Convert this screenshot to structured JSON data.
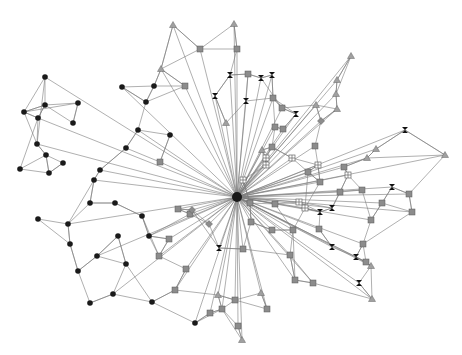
{
  "diagram": {
    "type": "network-graph",
    "hub": {
      "x": 237,
      "y": 197
    },
    "node_types": {
      "circle": "black",
      "square": "gray",
      "triangle": "gray",
      "grid-square": "white-crossed",
      "hourglass": "black",
      "diamond": "gray"
    },
    "colors": {
      "edge": "#7a7a7a",
      "black": "#1a1a1a",
      "gray": "#8c8c8c"
    },
    "nodes": [
      {
        "t": "circle",
        "x": 45,
        "y": 77
      },
      {
        "t": "circle",
        "x": 45,
        "y": 105
      },
      {
        "t": "circle",
        "x": 24,
        "y": 112
      },
      {
        "t": "circle",
        "x": 38,
        "y": 118
      },
      {
        "t": "circle",
        "x": 78,
        "y": 103
      },
      {
        "t": "circle",
        "x": 73,
        "y": 123
      },
      {
        "t": "circle",
        "x": 122,
        "y": 87
      },
      {
        "t": "circle",
        "x": 154,
        "y": 86
      },
      {
        "t": "circle",
        "x": 146,
        "y": 102
      },
      {
        "t": "circle",
        "x": 138,
        "y": 130
      },
      {
        "t": "circle",
        "x": 170,
        "y": 135
      },
      {
        "t": "circle",
        "x": 126,
        "y": 148
      },
      {
        "t": "circle",
        "x": 37,
        "y": 144
      },
      {
        "t": "circle",
        "x": 46,
        "y": 155
      },
      {
        "t": "circle",
        "x": 63,
        "y": 163
      },
      {
        "t": "circle",
        "x": 100,
        "y": 170
      },
      {
        "t": "circle",
        "x": 20,
        "y": 169
      },
      {
        "t": "circle",
        "x": 49,
        "y": 173
      },
      {
        "t": "circle",
        "x": 94,
        "y": 180
      },
      {
        "t": "circle",
        "x": 115,
        "y": 203
      },
      {
        "t": "circle",
        "x": 142,
        "y": 216
      },
      {
        "t": "circle",
        "x": 149,
        "y": 236
      },
      {
        "t": "circle",
        "x": 90,
        "y": 203
      },
      {
        "t": "circle",
        "x": 38,
        "y": 219
      },
      {
        "t": "circle",
        "x": 68,
        "y": 224
      },
      {
        "t": "circle",
        "x": 70,
        "y": 244
      },
      {
        "t": "circle",
        "x": 118,
        "y": 236
      },
      {
        "t": "circle",
        "x": 97,
        "y": 256
      },
      {
        "t": "circle",
        "x": 126,
        "y": 264
      },
      {
        "t": "circle",
        "x": 78,
        "y": 271
      },
      {
        "t": "circle",
        "x": 113,
        "y": 294
      },
      {
        "t": "circle",
        "x": 90,
        "y": 303
      },
      {
        "t": "circle",
        "x": 152,
        "y": 302
      },
      {
        "t": "circle",
        "x": 195,
        "y": 323
      },
      {
        "t": "triangle",
        "x": 173,
        "y": 25
      },
      {
        "t": "triangle",
        "x": 234,
        "y": 24
      },
      {
        "t": "triangle",
        "x": 161,
        "y": 69
      },
      {
        "t": "triangle",
        "x": 351,
        "y": 56
      },
      {
        "t": "triangle",
        "x": 337,
        "y": 80
      },
      {
        "t": "triangle",
        "x": 336,
        "y": 94
      },
      {
        "t": "triangle",
        "x": 316,
        "y": 105
      },
      {
        "t": "triangle",
        "x": 337,
        "y": 109
      },
      {
        "t": "triangle",
        "x": 226,
        "y": 123
      },
      {
        "t": "triangle",
        "x": 376,
        "y": 149
      },
      {
        "t": "triangle",
        "x": 445,
        "y": 155
      },
      {
        "t": "triangle",
        "x": 367,
        "y": 158
      },
      {
        "t": "triangle",
        "x": 262,
        "y": 150
      },
      {
        "t": "triangle",
        "x": 371,
        "y": 266
      },
      {
        "t": "triangle",
        "x": 372,
        "y": 299
      },
      {
        "t": "triangle",
        "x": 261,
        "y": 293
      },
      {
        "t": "triangle",
        "x": 242,
        "y": 340
      },
      {
        "t": "triangle",
        "x": 218,
        "y": 295
      },
      {
        "t": "square",
        "x": 200,
        "y": 49
      },
      {
        "t": "square",
        "x": 185,
        "y": 86
      },
      {
        "t": "square",
        "x": 237,
        "y": 49
      },
      {
        "t": "square",
        "x": 248,
        "y": 74
      },
      {
        "t": "square",
        "x": 273,
        "y": 98
      },
      {
        "t": "square",
        "x": 282,
        "y": 108
      },
      {
        "t": "square",
        "x": 275,
        "y": 127
      },
      {
        "t": "square",
        "x": 283,
        "y": 129
      },
      {
        "t": "square",
        "x": 272,
        "y": 147
      },
      {
        "t": "square",
        "x": 315,
        "y": 146
      },
      {
        "t": "square",
        "x": 160,
        "y": 162
      },
      {
        "t": "square",
        "x": 178,
        "y": 209
      },
      {
        "t": "square",
        "x": 190,
        "y": 214
      },
      {
        "t": "square",
        "x": 169,
        "y": 239
      },
      {
        "t": "square",
        "x": 159,
        "y": 256
      },
      {
        "t": "square",
        "x": 186,
        "y": 269
      },
      {
        "t": "square",
        "x": 175,
        "y": 290
      },
      {
        "t": "square",
        "x": 222,
        "y": 309
      },
      {
        "t": "square",
        "x": 210,
        "y": 313
      },
      {
        "t": "square",
        "x": 238,
        "y": 326
      },
      {
        "t": "square",
        "x": 243,
        "y": 249
      },
      {
        "t": "square",
        "x": 250,
        "y": 203
      },
      {
        "t": "square",
        "x": 272,
        "y": 230
      },
      {
        "t": "square",
        "x": 290,
        "y": 255
      },
      {
        "t": "square",
        "x": 295,
        "y": 280
      },
      {
        "t": "square",
        "x": 313,
        "y": 283
      },
      {
        "t": "square",
        "x": 235,
        "y": 300
      },
      {
        "t": "square",
        "x": 267,
        "y": 309
      },
      {
        "t": "square",
        "x": 275,
        "y": 204
      },
      {
        "t": "square",
        "x": 293,
        "y": 230
      },
      {
        "t": "square",
        "x": 319,
        "y": 229
      },
      {
        "t": "square",
        "x": 340,
        "y": 192
      },
      {
        "t": "square",
        "x": 362,
        "y": 190
      },
      {
        "t": "square",
        "x": 371,
        "y": 220
      },
      {
        "t": "square",
        "x": 382,
        "y": 203
      },
      {
        "t": "square",
        "x": 409,
        "y": 194
      },
      {
        "t": "square",
        "x": 412,
        "y": 212
      },
      {
        "t": "square",
        "x": 363,
        "y": 244
      },
      {
        "t": "square",
        "x": 366,
        "y": 262
      },
      {
        "t": "square",
        "x": 320,
        "y": 182
      },
      {
        "t": "square",
        "x": 308,
        "y": 172
      },
      {
        "t": "square",
        "x": 344,
        "y": 167
      },
      {
        "t": "square",
        "x": 251,
        "y": 222
      },
      {
        "t": "grid",
        "x": 266,
        "y": 158
      },
      {
        "t": "grid",
        "x": 292,
        "y": 158
      },
      {
        "t": "grid",
        "x": 266,
        "y": 165
      },
      {
        "t": "grid",
        "x": 318,
        "y": 165
      },
      {
        "t": "grid",
        "x": 348,
        "y": 175
      },
      {
        "t": "grid",
        "x": 305,
        "y": 208
      },
      {
        "t": "grid",
        "x": 299,
        "y": 202
      },
      {
        "t": "grid",
        "x": 243,
        "y": 180
      },
      {
        "t": "hourglass",
        "x": 230,
        "y": 75
      },
      {
        "t": "hourglass",
        "x": 261,
        "y": 78
      },
      {
        "t": "hourglass",
        "x": 272,
        "y": 75
      },
      {
        "t": "hourglass",
        "x": 215,
        "y": 96
      },
      {
        "t": "hourglass",
        "x": 246,
        "y": 101
      },
      {
        "t": "hourglass",
        "x": 296,
        "y": 114
      },
      {
        "t": "hourglass",
        "x": 405,
        "y": 130
      },
      {
        "t": "hourglass",
        "x": 392,
        "y": 187
      },
      {
        "t": "hourglass",
        "x": 320,
        "y": 212
      },
      {
        "t": "hourglass",
        "x": 332,
        "y": 208
      },
      {
        "t": "hourglass",
        "x": 356,
        "y": 257
      },
      {
        "t": "hourglass",
        "x": 359,
        "y": 283
      },
      {
        "t": "hourglass",
        "x": 332,
        "y": 247
      },
      {
        "t": "hourglass",
        "x": 219,
        "y": 248
      },
      {
        "t": "diamond",
        "x": 192,
        "y": 210
      },
      {
        "t": "diamond",
        "x": 209,
        "y": 224
      },
      {
        "t": "diamond",
        "x": 321,
        "y": 121
      }
    ]
  }
}
